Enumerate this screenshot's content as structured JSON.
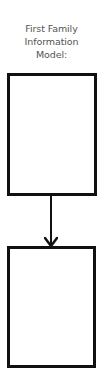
{
  "diagram": {
    "title_lines": [
      "First Family",
      "Information",
      "Model:"
    ],
    "boxes": [
      {
        "id": "box1",
        "label": ""
      },
      {
        "id": "box2",
        "label": ""
      }
    ],
    "connectors": [
      {
        "from": "box1",
        "to": "box2",
        "type": "arrow-down"
      }
    ],
    "colors": {
      "stroke": "#111111",
      "title_text": "#555555",
      "background": "#ffffff"
    }
  }
}
